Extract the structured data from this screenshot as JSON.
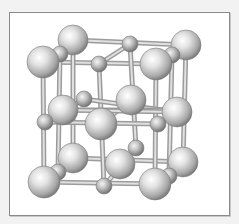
{
  "figure": {
    "colors": {
      "background": "#f2f2f2",
      "frame_border": "#8a8a8a",
      "frame_fill": "#ffffff",
      "atom_highlight": "#ffffff",
      "atom_mid": "#c4c4c4",
      "atom_shadow": "#6e6e6e",
      "bond": "#bdbdbd"
    },
    "atoms": [
      {
        "type": "large",
        "x": 73,
        "y": 40,
        "r": 15
      },
      {
        "type": "large",
        "x": 186,
        "y": 45,
        "r": 15
      },
      {
        "type": "small",
        "x": 130,
        "y": 44,
        "r": 8
      },
      {
        "type": "small",
        "x": 60,
        "y": 54,
        "r": 8
      },
      {
        "type": "small",
        "x": 172,
        "y": 55,
        "r": 8
      },
      {
        "type": "large",
        "x": 43,
        "y": 62,
        "r": 16
      },
      {
        "type": "small",
        "x": 99,
        "y": 64,
        "r": 8
      },
      {
        "type": "large",
        "x": 156,
        "y": 64,
        "r": 16
      },
      {
        "type": "small",
        "x": 84,
        "y": 99,
        "r": 8
      },
      {
        "type": "large",
        "x": 131,
        "y": 100,
        "r": 15
      },
      {
        "type": "large",
        "x": 63,
        "y": 110,
        "r": 15
      },
      {
        "type": "large",
        "x": 177,
        "y": 112,
        "r": 15
      },
      {
        "type": "small",
        "x": 45,
        "y": 122,
        "r": 8
      },
      {
        "type": "small",
        "x": 158,
        "y": 124,
        "r": 8
      },
      {
        "type": "large",
        "x": 101,
        "y": 124,
        "r": 16
      },
      {
        "type": "small",
        "x": 136,
        "y": 148,
        "r": 8
      },
      {
        "type": "large",
        "x": 73,
        "y": 158,
        "r": 15
      },
      {
        "type": "large",
        "x": 183,
        "y": 162,
        "r": 15
      },
      {
        "type": "large",
        "x": 120,
        "y": 164,
        "r": 15
      },
      {
        "type": "small",
        "x": 58,
        "y": 172,
        "r": 8
      },
      {
        "type": "small",
        "x": 169,
        "y": 176,
        "r": 8
      },
      {
        "type": "large",
        "x": 44,
        "y": 182,
        "r": 16
      },
      {
        "type": "small",
        "x": 104,
        "y": 186,
        "r": 8
      },
      {
        "type": "large",
        "x": 155,
        "y": 184,
        "r": 16
      }
    ],
    "bonds": [
      [
        43,
        62,
        156,
        64
      ],
      [
        73,
        40,
        186,
        45
      ],
      [
        43,
        62,
        73,
        40
      ],
      [
        156,
        64,
        186,
        45
      ],
      [
        44,
        182,
        155,
        184
      ],
      [
        73,
        158,
        183,
        162
      ],
      [
        44,
        182,
        73,
        158
      ],
      [
        155,
        184,
        183,
        162
      ],
      [
        43,
        62,
        44,
        182
      ],
      [
        156,
        64,
        155,
        184
      ],
      [
        73,
        40,
        73,
        158
      ],
      [
        186,
        45,
        183,
        162
      ],
      [
        99,
        64,
        104,
        186
      ],
      [
        130,
        44,
        136,
        148
      ],
      [
        60,
        54,
        58,
        172
      ],
      [
        172,
        55,
        169,
        176
      ],
      [
        43,
        122,
        158,
        124
      ],
      [
        84,
        99,
        177,
        112
      ],
      [
        63,
        110,
        183,
        110
      ],
      [
        45,
        122,
        84,
        99
      ],
      [
        101,
        124,
        131,
        100
      ],
      [
        63,
        110,
        177,
        112
      ],
      [
        99,
        64,
        130,
        44
      ],
      [
        104,
        186,
        136,
        148
      ],
      [
        45,
        122,
        63,
        110
      ],
      [
        158,
        124,
        177,
        112
      ]
    ]
  }
}
